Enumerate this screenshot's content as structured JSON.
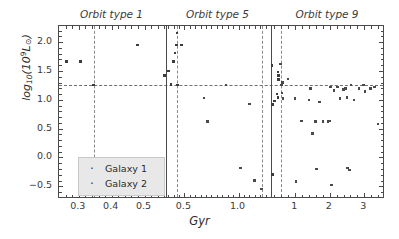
{
  "chart_data": {
    "type": "scatter",
    "title": "",
    "xlabel": "Gyr",
    "ylabel": "log10(10^9 L_sun)",
    "panels": [
      {
        "title": "Orbit type 1",
        "xlim": [
          0.24,
          0.565
        ],
        "xticks": [
          0.3,
          0.4,
          0.5
        ],
        "xticklabels": [
          "0.3",
          "0.4",
          "0.5"
        ],
        "vline": 0.345,
        "points": [
          {
            "x": 0.262,
            "y": 1.66,
            "series": "Galaxy 1"
          },
          {
            "x": 0.305,
            "y": 1.66,
            "series": "Galaxy 1"
          },
          {
            "x": 0.345,
            "y": 1.26,
            "series": "Galaxy 1"
          },
          {
            "x": 0.478,
            "y": 1.95,
            "series": "Galaxy 1"
          },
          {
            "x": 0.561,
            "y": 1.42,
            "series": "Galaxy 1"
          }
        ]
      },
      {
        "title": "Orbit type 5",
        "xlim": [
          0.33,
          1.3
        ],
        "xticks": [
          0.5,
          1.0
        ],
        "xticklabels": [
          "0.5",
          "1.0"
        ],
        "vline_left": 0.435,
        "vline_right": 1.215,
        "points": [
          {
            "x": 0.352,
            "y": 1.5,
            "series": "Galaxy 1"
          },
          {
            "x": 0.378,
            "y": 1.27,
            "series": "Galaxy 1"
          },
          {
            "x": 0.398,
            "y": 1.66,
            "series": "Galaxy 1"
          },
          {
            "x": 0.412,
            "y": 1.81,
            "series": "Galaxy 1"
          },
          {
            "x": 0.428,
            "y": 1.95,
            "series": "Galaxy 1"
          },
          {
            "x": 0.432,
            "y": 2.16,
            "series": "Galaxy 1"
          },
          {
            "x": 0.435,
            "y": 1.26,
            "series": "Galaxy 1"
          },
          {
            "x": 0.472,
            "y": 1.95,
            "series": "Galaxy 1"
          },
          {
            "x": 0.68,
            "y": 1.03,
            "series": "Galaxy 2"
          },
          {
            "x": 0.715,
            "y": 0.62,
            "series": "Galaxy 2"
          },
          {
            "x": 0.885,
            "y": 1.26,
            "series": "Galaxy 2"
          },
          {
            "x": 1.02,
            "y": -0.18,
            "series": "Galaxy 2"
          },
          {
            "x": 1.1,
            "y": 0.93,
            "series": "Galaxy 2"
          },
          {
            "x": 1.145,
            "y": -0.4,
            "series": "Galaxy 2"
          },
          {
            "x": 1.21,
            "y": -0.55,
            "series": "Galaxy 2"
          }
        ]
      },
      {
        "title": "Orbit type 9",
        "xlim": [
          0.3,
          3.6
        ],
        "xticks": [
          1,
          2,
          3
        ],
        "xticklabels": [
          "1",
          "2",
          "3"
        ],
        "vline": 0.6,
        "points": [
          {
            "x": 0.33,
            "y": 1.6,
            "series": "Galaxy 1"
          },
          {
            "x": 0.345,
            "y": 0.92,
            "series": "Galaxy 1"
          },
          {
            "x": 0.5,
            "y": 1.48,
            "series": "Galaxy 1"
          },
          {
            "x": 0.515,
            "y": 1.42,
            "series": "Galaxy 1"
          },
          {
            "x": 0.525,
            "y": 1.35,
            "series": "Galaxy 1"
          },
          {
            "x": 0.47,
            "y": 1.1,
            "series": "Galaxy 1"
          },
          {
            "x": 0.5,
            "y": 1.04,
            "series": "Galaxy 1"
          },
          {
            "x": 0.4,
            "y": 0.98,
            "series": "Galaxy 1"
          },
          {
            "x": 0.345,
            "y": -0.3,
            "series": "Galaxy 1"
          },
          {
            "x": 0.57,
            "y": 1.62,
            "series": "Galaxy 2"
          },
          {
            "x": 0.585,
            "y": 1.26,
            "series": "Galaxy 2"
          },
          {
            "x": 0.6,
            "y": 1.26,
            "series": "Galaxy 2"
          },
          {
            "x": 0.625,
            "y": 1.3,
            "series": "Galaxy 2"
          },
          {
            "x": 0.62,
            "y": 1.12,
            "series": "Galaxy 2"
          },
          {
            "x": 0.645,
            "y": 1.02,
            "series": "Galaxy 2"
          },
          {
            "x": 0.79,
            "y": 1.36,
            "series": "Galaxy 2"
          },
          {
            "x": 1.0,
            "y": 1.02,
            "series": "Galaxy 2"
          },
          {
            "x": 1.02,
            "y": -0.42,
            "series": "Galaxy 2"
          },
          {
            "x": 1.18,
            "y": 0.63,
            "series": "Galaxy 2"
          },
          {
            "x": 1.4,
            "y": 1.0,
            "series": "Galaxy 2"
          },
          {
            "x": 1.45,
            "y": 1.2,
            "series": "Galaxy 2"
          },
          {
            "x": 1.5,
            "y": 0.42,
            "series": "Galaxy 2"
          },
          {
            "x": 1.58,
            "y": 0.62,
            "series": "Galaxy 2"
          },
          {
            "x": 1.62,
            "y": -0.2,
            "series": "Galaxy 2"
          },
          {
            "x": 1.7,
            "y": 0.96,
            "series": "Galaxy 2"
          },
          {
            "x": 1.8,
            "y": 0.62,
            "series": "Galaxy 2"
          },
          {
            "x": 1.95,
            "y": 0.62,
            "series": "Galaxy 2"
          },
          {
            "x": 2.0,
            "y": 0.63,
            "series": "Galaxy 2"
          },
          {
            "x": 2.02,
            "y": 1.22,
            "series": "Galaxy 2"
          },
          {
            "x": 2.05,
            "y": -0.48,
            "series": "Galaxy 2"
          },
          {
            "x": 2.12,
            "y": 1.16,
            "series": "Galaxy 2"
          },
          {
            "x": 2.22,
            "y": 1.22,
            "series": "Galaxy 2"
          },
          {
            "x": 2.3,
            "y": 1.02,
            "series": "Galaxy 2"
          },
          {
            "x": 2.4,
            "y": 1.18,
            "series": "Galaxy 2"
          },
          {
            "x": 2.45,
            "y": 1.2,
            "series": "Galaxy 2"
          },
          {
            "x": 2.5,
            "y": 1.04,
            "series": "Galaxy 2"
          },
          {
            "x": 2.52,
            "y": -0.18,
            "series": "Galaxy 2"
          },
          {
            "x": 2.57,
            "y": -0.22,
            "series": "Galaxy 2"
          },
          {
            "x": 2.62,
            "y": 1.26,
            "series": "Galaxy 2"
          },
          {
            "x": 2.7,
            "y": 1.0,
            "series": "Galaxy 2"
          },
          {
            "x": 2.85,
            "y": 1.2,
            "series": "Galaxy 2"
          },
          {
            "x": 2.98,
            "y": 1.26,
            "series": "Galaxy 2"
          },
          {
            "x": 3.02,
            "y": 1.14,
            "series": "Galaxy 2"
          },
          {
            "x": 3.18,
            "y": 1.2,
            "series": "Galaxy 2"
          },
          {
            "x": 3.3,
            "y": 1.22,
            "series": "Galaxy 2"
          },
          {
            "x": 3.4,
            "y": 0.58,
            "series": "Galaxy 2"
          }
        ]
      }
    ],
    "ylim": [
      -0.72,
      2.28
    ],
    "yticks": [
      -0.5,
      0.0,
      0.5,
      1.0,
      1.5,
      2.0
    ],
    "yticklabels": [
      "−0.5",
      "0.0",
      "0.5",
      "1.0",
      "1.5",
      "2.0"
    ],
    "hline": 1.26,
    "grid": false,
    "legend": {
      "position": "lower-left",
      "entries": [
        {
          "label": "Galaxy 1",
          "color": "#3c3c3c",
          "marker": "·"
        },
        {
          "label": "Galaxy 2",
          "color": "#4a4a4a",
          "marker": "·"
        }
      ]
    }
  },
  "axes": {
    "ylabel_prefix": "log",
    "ylabel_sub": "10",
    "ylabel_open": "(10",
    "ylabel_sup": "9",
    "ylabel_lum": "L",
    "ylabel_sun": "⊙",
    "ylabel_close": ")",
    "xlabel": "Gyr"
  },
  "panel_titles": [
    "Orbit type 1",
    "Orbit type 5",
    "Orbit type 9"
  ],
  "colors": {
    "axis": "#4a4a4a",
    "point": "#3c3c3c",
    "refline": "#6e6e6e",
    "legend_bg": "#e8e8e8"
  }
}
